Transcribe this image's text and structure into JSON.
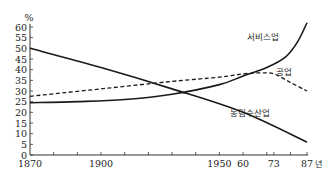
{
  "chart_data": {
    "type": "line",
    "title": "",
    "ylabel": "%",
    "xlabel": "년",
    "ylim": [
      0,
      60
    ],
    "y_ticks": [
      0,
      5,
      10,
      15,
      20,
      25,
      30,
      35,
      40,
      45,
      50,
      55,
      60
    ],
    "x_tick_labels": [
      "1870",
      "1900",
      "1950",
      "60",
      "73",
      "87"
    ],
    "x_tick_years": [
      1870,
      1900,
      1950,
      1960,
      1973,
      1987
    ],
    "xlim": [
      1870,
      1987
    ],
    "grid": false,
    "series": [
      {
        "name": "서비스업",
        "style": "solid",
        "x": [
          1870,
          1890,
          1910,
          1930,
          1950,
          1960,
          1970,
          1978,
          1983,
          1987
        ],
        "y": [
          24.5,
          25,
          26,
          28.5,
          33,
          37,
          41,
          46,
          53,
          62
        ]
      },
      {
        "name": "공업",
        "style": "dashed",
        "x": [
          1870,
          1900,
          1930,
          1950,
          1960,
          1967,
          1973,
          1980,
          1987
        ],
        "y": [
          27.5,
          31,
          34.5,
          36.5,
          38,
          38.5,
          38,
          34,
          30
        ]
      },
      {
        "name": "농림수산업",
        "style": "solid",
        "x": [
          1870,
          1900,
          1930,
          1960,
          1987
        ],
        "y": [
          50,
          41,
          31,
          20,
          6
        ]
      }
    ],
    "annotations": [
      {
        "text": "서비스업",
        "near_series": "서비스업"
      },
      {
        "text": "공업",
        "near_series": "공업"
      },
      {
        "text": "농림수산업",
        "near_series": "농림수산업"
      }
    ]
  }
}
